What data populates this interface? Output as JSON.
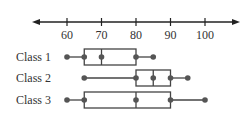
{
  "chart_data": {
    "type": "boxplot",
    "title": "",
    "xlabel": "",
    "ylabel": "",
    "xlim": [
      51,
      110
    ],
    "ticks": [
      60,
      70,
      80,
      90,
      100
    ],
    "tick_labels": [
      "60",
      "70",
      "80",
      "90",
      "100"
    ],
    "axis_arrows": "both",
    "grid": false,
    "legend": "none",
    "series": [
      {
        "name": "Class 1",
        "min": 60,
        "q1": 65,
        "median": 70,
        "q3": 80,
        "max": 85
      },
      {
        "name": "Class 2",
        "min": 65,
        "q1": 80,
        "median": 85,
        "q3": 90,
        "max": 95
      },
      {
        "name": "Class 3",
        "min": 60,
        "q1": 65,
        "median": 80,
        "q3": 90,
        "max": 100
      }
    ],
    "colors": {
      "line": "#444444",
      "point": "#555555",
      "text": "#333333"
    }
  }
}
